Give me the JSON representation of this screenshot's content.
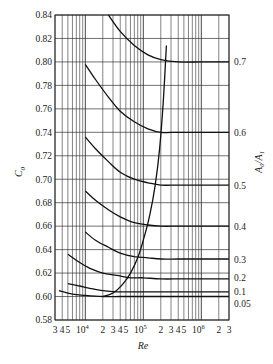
{
  "chart_data": {
    "type": "line",
    "title": "",
    "xlabel": "Re",
    "ylabel": "C0",
    "right_label": "A0/A1",
    "xscale": "log",
    "xlim": [
      3000,
      3000000
    ],
    "ylim": [
      0.58,
      0.84
    ],
    "grid": true,
    "y_ticks": [
      "0.58",
      "0.60",
      "0.62",
      "0.64",
      "0.66",
      "0.68",
      "0.70",
      "0.72",
      "0.74",
      "0.76",
      "0.78",
      "0.80",
      "0.82",
      "0.84"
    ],
    "x_tick_labels": [
      {
        "value": 3000,
        "label": "3"
      },
      {
        "value": 4000,
        "label": "4"
      },
      {
        "value": 5000,
        "label": "5"
      },
      {
        "value": 10000,
        "label": "10",
        "sup": "4"
      },
      {
        "value": 20000,
        "label": "2"
      },
      {
        "value": 30000,
        "label": "3"
      },
      {
        "value": 40000,
        "label": "4"
      },
      {
        "value": 50000,
        "label": "5"
      },
      {
        "value": 100000,
        "label": "10",
        "sup": "5"
      },
      {
        "value": 200000,
        "label": "2"
      },
      {
        "value": 300000,
        "label": "3"
      },
      {
        "value": 400000,
        "label": "4"
      },
      {
        "value": 500000,
        "label": "5"
      },
      {
        "value": 1000000,
        "label": "10",
        "sup": "6"
      },
      {
        "value": 2000000,
        "label": "2"
      },
      {
        "value": 3000000,
        "label": "3"
      }
    ],
    "series": [
      {
        "name": "0.7",
        "x": [
          25000,
          40000,
          70000,
          120000,
          200000,
          400000,
          1000000,
          3000000
        ],
        "y": [
          0.84,
          0.826,
          0.814,
          0.806,
          0.802,
          0.8,
          0.8,
          0.8
        ]
      },
      {
        "name": "0.6",
        "x": [
          10000,
          15000,
          25000,
          40000,
          70000,
          120000,
          200000,
          400000,
          1000000,
          3000000
        ],
        "y": [
          0.798,
          0.785,
          0.77,
          0.758,
          0.749,
          0.743,
          0.74,
          0.74,
          0.74,
          0.74
        ]
      },
      {
        "name": "0.5",
        "x": [
          10000,
          15000,
          25000,
          40000,
          70000,
          120000,
          200000,
          400000,
          1000000,
          3000000
        ],
        "y": [
          0.736,
          0.726,
          0.715,
          0.706,
          0.7,
          0.697,
          0.695,
          0.695,
          0.695,
          0.695
        ]
      },
      {
        "name": "0.4",
        "x": [
          10000,
          15000,
          25000,
          40000,
          70000,
          120000,
          200000,
          400000,
          1000000,
          3000000
        ],
        "y": [
          0.69,
          0.682,
          0.674,
          0.668,
          0.663,
          0.661,
          0.66,
          0.66,
          0.66,
          0.66
        ]
      },
      {
        "name": "0.3",
        "x": [
          10000,
          15000,
          25000,
          40000,
          70000,
          120000,
          200000,
          400000,
          1000000,
          3000000
        ],
        "y": [
          0.655,
          0.648,
          0.642,
          0.637,
          0.634,
          0.633,
          0.632,
          0.632,
          0.632,
          0.632
        ]
      },
      {
        "name": "0.2",
        "x": [
          5000,
          8000,
          12000,
          20000,
          35000,
          60000,
          100000,
          200000,
          500000,
          3000000
        ],
        "y": [
          0.636,
          0.629,
          0.624,
          0.62,
          0.618,
          0.616,
          0.616,
          0.615,
          0.615,
          0.615
        ]
      },
      {
        "name": "0.1",
        "x": [
          5000,
          8000,
          12000,
          20000,
          35000,
          60000,
          100000,
          300000,
          3000000
        ],
        "y": [
          0.611,
          0.609,
          0.607,
          0.605,
          0.604,
          0.604,
          0.604,
          0.604,
          0.604
        ]
      },
      {
        "name": "0.05",
        "x": [
          3500,
          6000,
          10000,
          20000,
          40000,
          100000,
          300000,
          3000000
        ],
        "y": [
          0.605,
          0.602,
          0.601,
          0.6,
          0.6,
          0.6,
          0.6,
          0.6
        ]
      },
      {
        "name": "limit",
        "x": [
          20000,
          30000,
          45000,
          60000,
          80000,
          100000,
          130000,
          160000,
          190000,
          220000,
          250000
        ],
        "y": [
          0.6,
          0.603,
          0.611,
          0.62,
          0.633,
          0.648,
          0.67,
          0.695,
          0.725,
          0.765,
          0.814
        ]
      }
    ]
  },
  "axes": {
    "ylabel_main": "C",
    "ylabel_sub": "0",
    "xlabel": "Re",
    "right_label": "A₀/A₁"
  },
  "right_labels": [
    {
      "text": "0.7",
      "value": 0.8
    },
    {
      "text": "0.6",
      "value": 0.74
    },
    {
      "text": "0.5",
      "value": 0.695
    },
    {
      "text": "0.4",
      "value": 0.66
    },
    {
      "text": "0.3",
      "value": 0.632
    },
    {
      "text": "0.2",
      "value": 0.616
    },
    {
      "text": "0.1",
      "value": 0.604
    },
    {
      "text": "0.05",
      "value": 0.599
    }
  ]
}
